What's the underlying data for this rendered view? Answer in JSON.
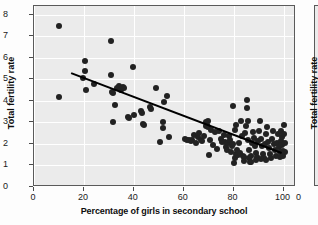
{
  "chart_data": {
    "type": "scatter",
    "title": "",
    "xlabel": "Percentage of girls in secondary school",
    "ylabel": "Total fertility rate",
    "xlim": [
      0,
      105
    ],
    "ylim": [
      0,
      8.4
    ],
    "xticks": [
      0,
      20,
      40,
      60,
      80,
      100
    ],
    "yticks": [
      0,
      1,
      2,
      3,
      4,
      5,
      6,
      7,
      8
    ],
    "grid": true,
    "legend": false,
    "marker_color": "#222222",
    "plot_background": "#ebebeb",
    "gridline_color": "#ffffff",
    "trendline": {
      "type": "linear",
      "color": "#000000",
      "x_start": 15,
      "y_start": 5.25,
      "x_end": 100,
      "y_end": 1.5
    },
    "points": [
      [
        10.0,
        7.48
      ],
      [
        10.2,
        4.18
      ],
      [
        19.5,
        5.05
      ],
      [
        20.3,
        5.85
      ],
      [
        20.5,
        5.38
      ],
      [
        20.8,
        4.52
      ],
      [
        24.0,
        4.78
      ],
      [
        30.8,
        6.78
      ],
      [
        30.9,
        5.22
      ],
      [
        31.2,
        4.42
      ],
      [
        31.5,
        4.35
      ],
      [
        31.8,
        3.02
      ],
      [
        32.5,
        3.8
      ],
      [
        33.2,
        4.58
      ],
      [
        34.0,
        4.7
      ],
      [
        34.8,
        4.52
      ],
      [
        35.6,
        4.62
      ],
      [
        36.0,
        4.6
      ],
      [
        37.5,
        3.26
      ],
      [
        38.2,
        3.18
      ],
      [
        39.8,
        5.58
      ],
      [
        40.0,
        3.34
      ],
      [
        42.8,
        3.52
      ],
      [
        43.2,
        3.42
      ],
      [
        43.5,
        2.92
      ],
      [
        44.2,
        2.9
      ],
      [
        46.5,
        3.7
      ],
      [
        47.0,
        3.62
      ],
      [
        48.8,
        4.58
      ],
      [
        50.5,
        2.08
      ],
      [
        51.5,
        3.0
      ],
      [
        51.8,
        2.74
      ],
      [
        52.2,
        3.94
      ],
      [
        53.5,
        4.24
      ],
      [
        54.0,
        2.3
      ],
      [
        60.5,
        2.22
      ],
      [
        61.2,
        2.2
      ],
      [
        62.0,
        2.16
      ],
      [
        62.8,
        2.14
      ],
      [
        63.5,
        2.18
      ],
      [
        64.0,
        2.42
      ],
      [
        65.0,
        2.06
      ],
      [
        65.8,
        2.3
      ],
      [
        66.2,
        2.52
      ],
      [
        67.0,
        2.2
      ],
      [
        67.5,
        2.12
      ],
      [
        68.2,
        2.36
      ],
      [
        68.8,
        2.82
      ],
      [
        69.0,
        3.0
      ],
      [
        69.3,
        2.88
      ],
      [
        69.6,
        3.06
      ],
      [
        69.9,
        2.78
      ],
      [
        70.0,
        1.48
      ],
      [
        70.4,
        2.16
      ],
      [
        71.0,
        2.66
      ],
      [
        74.0,
        2.6
      ],
      [
        74.8,
        2.24
      ],
      [
        75.2,
        2.08
      ],
      [
        76.0,
        2.42
      ],
      [
        76.5,
        2.1
      ],
      [
        77.0,
        1.86
      ],
      [
        77.4,
        1.7
      ],
      [
        77.8,
        2.02
      ],
      [
        78.2,
        2.36
      ],
      [
        78.6,
        2.18
      ],
      [
        79.0,
        1.64
      ],
      [
        79.4,
        1.92
      ],
      [
        79.6,
        2.0
      ],
      [
        79.8,
        3.78
      ],
      [
        80.0,
        1.12
      ],
      [
        80.4,
        1.36
      ],
      [
        80.8,
        1.52
      ],
      [
        81.2,
        1.74
      ],
      [
        81.6,
        1.48
      ],
      [
        82.0,
        2.04
      ],
      [
        82.4,
        1.6
      ],
      [
        82.8,
        3.04
      ],
      [
        83.2,
        2.36
      ],
      [
        83.6,
        1.42
      ],
      [
        84.0,
        1.38
      ],
      [
        84.4,
        2.52
      ],
      [
        84.8,
        2.82
      ],
      [
        85.2,
        4.04
      ],
      [
        85.4,
        3.68
      ],
      [
        85.6,
        3.08
      ],
      [
        85.8,
        2.2
      ],
      [
        86.0,
        1.72
      ],
      [
        86.2,
        1.36
      ],
      [
        86.4,
        1.18
      ],
      [
        86.8,
        1.44
      ],
      [
        87.2,
        2.06
      ],
      [
        87.6,
        2.54
      ],
      [
        88.0,
        2.28
      ],
      [
        88.4,
        1.92
      ],
      [
        88.8,
        1.6
      ],
      [
        89.2,
        1.4
      ],
      [
        89.6,
        2.12
      ],
      [
        90.0,
        2.62
      ],
      [
        90.4,
        3.08
      ],
      [
        90.8,
        2.22
      ],
      [
        91.2,
        1.88
      ],
      [
        91.6,
        1.54
      ],
      [
        92.0,
        1.36
      ],
      [
        92.4,
        2.0
      ],
      [
        92.8,
        2.46
      ],
      [
        93.2,
        2.78
      ],
      [
        93.6,
        2.1
      ],
      [
        94.0,
        1.8
      ],
      [
        94.4,
        1.52
      ],
      [
        94.8,
        1.34
      ],
      [
        95.2,
        2.22
      ],
      [
        95.6,
        2.58
      ],
      [
        96.0,
        1.98
      ],
      [
        96.4,
        1.72
      ],
      [
        96.8,
        1.44
      ],
      [
        97.2,
        2.06
      ],
      [
        97.6,
        2.44
      ],
      [
        98.0,
        1.86
      ],
      [
        98.4,
        1.62
      ],
      [
        98.6,
        1.4
      ],
      [
        98.8,
        2.12
      ],
      [
        99.0,
        2.62
      ],
      [
        99.2,
        2.3
      ],
      [
        99.4,
        1.94
      ],
      [
        99.6,
        1.68
      ],
      [
        99.8,
        1.46
      ],
      [
        100.0,
        2.86
      ],
      [
        100.2,
        2.48
      ],
      [
        100.4,
        2.04
      ],
      [
        100.5,
        1.62
      ],
      [
        71.8,
        1.96
      ],
      [
        72.5,
        2.54
      ],
      [
        73.2,
        1.78
      ],
      [
        80.6,
        2.64
      ],
      [
        81.0,
        2.9
      ],
      [
        84.2,
        1.22
      ],
      [
        87.0,
        1.14
      ],
      [
        89.0,
        1.26
      ],
      [
        91.0,
        1.3
      ],
      [
        93.0,
        1.26
      ]
    ]
  },
  "axes": {
    "x_tick_labels": [
      "0",
      "20",
      "40",
      "60",
      "80",
      "100"
    ],
    "y_tick_labels": [
      "0",
      "1",
      "2",
      "3",
      "4",
      "5",
      "6",
      "7",
      "8"
    ],
    "x_axis_title": "Percentage of girls in secondary school",
    "y_axis_title": "Total fertility rate"
  },
  "adjacent_panel": {
    "y_axis_title": "Total fertility rate",
    "x_tick_label": "0"
  }
}
